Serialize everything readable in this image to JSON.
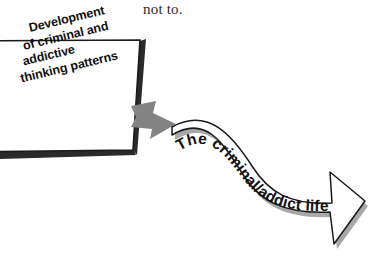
{
  "figure": {
    "type": "flow-diagram",
    "caption_fragment": "not to.",
    "background_color": "#ffffff"
  },
  "box": {
    "name": "development-box",
    "lines": [
      "Development",
      "of criminal and",
      "addictive",
      "thinking patterns"
    ],
    "full_text": "Development of criminal and addictive thinking patterns",
    "fill_color": "#ffffff",
    "border_color": "#1a1a1a",
    "shadow_color": "#222222",
    "rotation_degrees": -13.5
  },
  "connector": {
    "name": "gray-block-arrow",
    "direction": "right",
    "fill_color": "#808080",
    "label": ""
  },
  "banner": {
    "name": "life-course-banner",
    "label": "The criminal/addict life course",
    "shape": "s-curved-arrow",
    "fill_color": "#ffffff",
    "outline_color": "#1a1a1a",
    "shadow_color": "#9a9a9a",
    "arrowhead_direction": "down-right"
  }
}
